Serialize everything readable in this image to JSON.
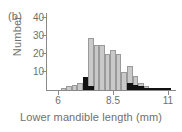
{
  "panel": {
    "label": "(b)"
  },
  "axes": {
    "y_title": "Number",
    "x_title": "Lower mandible length (mm)",
    "y_ticks": [
      "10",
      "20",
      "30",
      "40"
    ],
    "x_ticks": [
      "6",
      "8.5",
      "11"
    ]
  },
  "colors": {
    "gray_fill": "#c9c9c9",
    "gray_edge": "#9a9a9a",
    "dark_fill": "#121212",
    "axis": "#8a8a8a",
    "text": "#6f6f6f",
    "background": "#ffffff"
  },
  "chart_data": {
    "type": "bar",
    "title": "(b)",
    "xlabel": "Lower mandible length (mm)",
    "ylabel": "Number",
    "xlim": [
      5.5,
      11.3
    ],
    "ylim": [
      0,
      42
    ],
    "grid": false,
    "legend": "none",
    "bin_width": 0.25,
    "series": [
      {
        "name": "light-gray-histogram",
        "color": "#c9c9c9",
        "x": [
          6.25,
          6.5,
          6.75,
          7.0,
          7.25,
          7.5,
          7.75,
          8.0,
          8.25,
          8.5,
          8.75,
          9.0,
          9.25,
          9.5,
          9.75,
          10.0,
          10.25,
          10.5,
          10.75,
          11.0
        ],
        "values": [
          1,
          2,
          3,
          4,
          7,
          29,
          25,
          25,
          20,
          22,
          20,
          10,
          13,
          8,
          4,
          2,
          1,
          1,
          1,
          1
        ]
      },
      {
        "name": "black-histogram",
        "color": "#121212",
        "x": [
          7.25,
          7.5,
          9.25,
          9.5,
          9.75,
          10.0,
          10.25,
          10.5,
          10.75,
          11.0
        ],
        "values": [
          7,
          2,
          4,
          3,
          2,
          1,
          1,
          1,
          1,
          1
        ]
      }
    ]
  }
}
